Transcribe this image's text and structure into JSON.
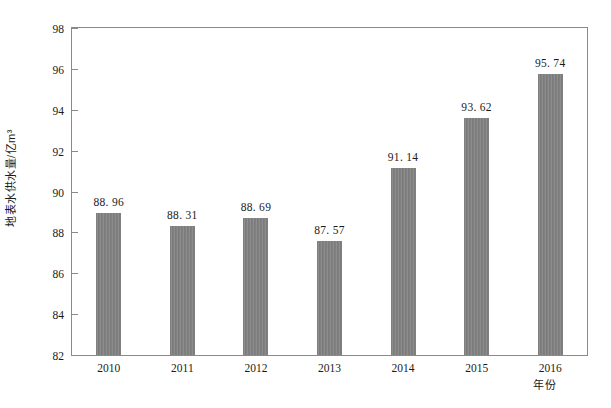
{
  "chart_data": {
    "type": "bar",
    "title": "",
    "xlabel": "年份",
    "ylabel": "地表水供水量/亿m³",
    "categories": [
      "2010",
      "2011",
      "2012",
      "2013",
      "2014",
      "2015",
      "2016"
    ],
    "values": [
      88.96,
      88.31,
      88.69,
      87.57,
      91.14,
      93.62,
      95.74
    ],
    "value_labels": [
      "88. 96",
      "88. 31",
      "88. 69",
      "87. 57",
      "91. 14",
      "93. 62",
      "95. 74"
    ],
    "ylim": [
      82,
      98
    ],
    "yticks": [
      82,
      84,
      86,
      88,
      90,
      92,
      94,
      96,
      98
    ],
    "ytick_labels": [
      "82",
      "84",
      "86",
      "88",
      "90",
      "92",
      "94",
      "96",
      "98"
    ],
    "grid": false,
    "legend": false,
    "legend_position": "none",
    "bar_color": "#808080",
    "axis_color": "#8a8a8a",
    "background_color": "#ffffff",
    "text_color": "#1a1a1a"
  }
}
